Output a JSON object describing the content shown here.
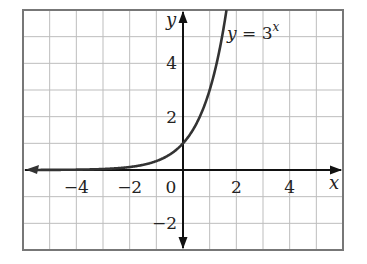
{
  "chart_data": {
    "type": "line",
    "title": "",
    "xlabel": "x",
    "ylabel": "y",
    "xlim": [
      -6,
      6
    ],
    "ylim": [
      -3,
      6
    ],
    "grid": true,
    "x_ticks": [
      {
        "value": -4,
        "label": "−4"
      },
      {
        "value": -2,
        "label": "−2"
      },
      {
        "value": 0,
        "label": "0"
      },
      {
        "value": 2,
        "label": "2"
      },
      {
        "value": 4,
        "label": "4"
      }
    ],
    "y_ticks": [
      {
        "value": 4,
        "label": "4"
      },
      {
        "value": 2,
        "label": "2"
      },
      {
        "value": -2,
        "label": "−2"
      }
    ],
    "series": [
      {
        "name": "y = 3^x",
        "function": "3^x",
        "x": [
          -6,
          -5,
          -4,
          -3,
          -2,
          -1,
          0,
          0.5,
          1,
          1.5,
          1.63
        ],
        "y": [
          0.0014,
          0.0041,
          0.0123,
          0.037,
          0.111,
          0.333,
          1,
          1.732,
          3,
          5.196,
          6
        ]
      }
    ],
    "annotation": {
      "lhs": "y",
      "op": " = ",
      "base": "3",
      "exp": "x"
    },
    "colors": {
      "grid": "#bdbdbd",
      "frame": "#777777",
      "axis": "#111111",
      "curve": "#333333"
    }
  }
}
